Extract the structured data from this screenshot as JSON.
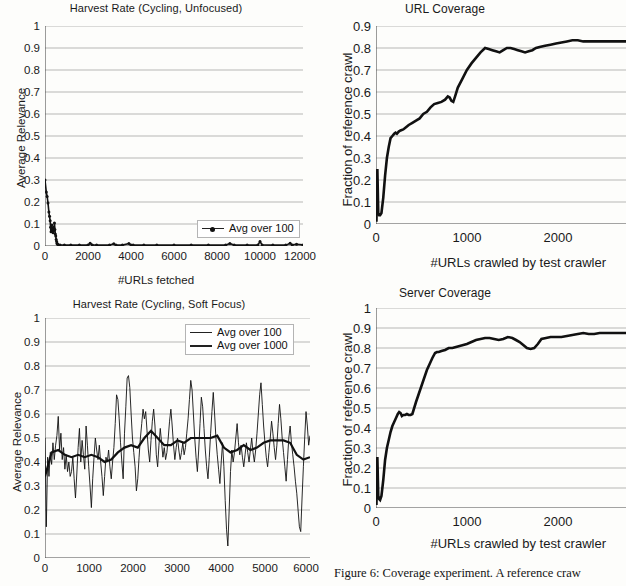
{
  "figure": {
    "caption": "Figure 6: Coverage experiment.  A reference craw",
    "background": "#fdfdfb",
    "line_color": "#111111",
    "grid_color": "#9a9a9a"
  },
  "charts": [
    {
      "id": "harvest-unfocused",
      "type": "line",
      "title": "Harvest Rate (Cycling, Unfocused)",
      "xlabel": "#URLs fetched",
      "ylabel": "Average Relevance",
      "xlim": [
        0,
        12000
      ],
      "ylim": [
        0,
        1
      ],
      "xticks": [
        0,
        2000,
        4000,
        6000,
        8000,
        10000,
        12000
      ],
      "yticks": [
        "0",
        "0.1",
        "0.2",
        "0.3",
        "0.4",
        "0.5",
        "0.6",
        "0.7",
        "0.8",
        "0.9",
        "1"
      ],
      "grid": true,
      "legend_position": "inside-bottom-right",
      "series": [
        {
          "name": "Avg over 100",
          "style": "thin-marker",
          "x": [
            0,
            60,
            100,
            140,
            180,
            210,
            240,
            260,
            280,
            300,
            320,
            340,
            360,
            380,
            400,
            420,
            440,
            460,
            480,
            500,
            520,
            540,
            560,
            580,
            620,
            700,
            900,
            1200,
            1600,
            2000,
            2100,
            2200,
            2400,
            3000,
            3200,
            3300,
            3600,
            3900,
            4000,
            4100,
            4600,
            5200,
            6000,
            6800,
            7600,
            8400,
            8600,
            8800,
            9400,
            9900,
            10000,
            10100,
            10600,
            11200,
            11400,
            11500,
            11700,
            12000
          ],
          "y": [
            0.3,
            0.245,
            0.225,
            0.195,
            0.155,
            0.135,
            0.115,
            0.085,
            0.065,
            0.075,
            0.095,
            0.065,
            0.08,
            0.06,
            0.085,
            0.07,
            0.105,
            0.075,
            0.055,
            0.045,
            0.03,
            0.02,
            0.012,
            0.008,
            0.006,
            0.005,
            0.004,
            0.004,
            0.004,
            0.004,
            0.012,
            0.005,
            0.004,
            0.004,
            0.01,
            0.004,
            0.004,
            0.011,
            0.005,
            0.004,
            0.004,
            0.004,
            0.004,
            0.004,
            0.004,
            0.004,
            0.011,
            0.004,
            0.004,
            0.004,
            0.02,
            0.005,
            0.004,
            0.004,
            0.012,
            0.005,
            0.008,
            0.005
          ]
        }
      ]
    },
    {
      "id": "harvest-soft-focus",
      "type": "line",
      "title": "Harvest Rate (Cycling, Soft Focus)",
      "xlabel": "",
      "ylabel": "Average Relevance",
      "xlim": [
        0,
        6000
      ],
      "ylim": [
        0,
        1
      ],
      "xticks": [
        0,
        1000,
        2000,
        3000,
        4000,
        5000,
        6000
      ],
      "yticks": [
        "0",
        "0.1",
        "0.2",
        "0.3",
        "0.4",
        "0.5",
        "0.6",
        "0.7",
        "0.8",
        "0.9",
        "1"
      ],
      "grid": true,
      "legend_position": "inside-top-right",
      "series": [
        {
          "name": "Avg over 100",
          "style": "thin",
          "x": [
            0,
            30,
            60,
            90,
            120,
            150,
            180,
            210,
            240,
            270,
            300,
            330,
            360,
            390,
            420,
            450,
            480,
            510,
            540,
            570,
            600,
            630,
            660,
            690,
            720,
            750,
            780,
            810,
            840,
            870,
            900,
            930,
            960,
            990,
            1020,
            1050,
            1080,
            1110,
            1140,
            1170,
            1200,
            1230,
            1260,
            1290,
            1320,
            1350,
            1380,
            1410,
            1440,
            1470,
            1500,
            1530,
            1560,
            1590,
            1620,
            1650,
            1680,
            1710,
            1740,
            1770,
            1800,
            1830,
            1860,
            1890,
            1920,
            1950,
            1980,
            2010,
            2040,
            2070,
            2100,
            2130,
            2160,
            2190,
            2220,
            2250,
            2280,
            2310,
            2340,
            2370,
            2400,
            2430,
            2460,
            2490,
            2520,
            2550,
            2580,
            2610,
            2640,
            2670,
            2700,
            2730,
            2760,
            2790,
            2820,
            2850,
            2880,
            2910,
            2940,
            2970,
            3000,
            3030,
            3060,
            3090,
            3120,
            3150,
            3180,
            3210,
            3240,
            3270,
            3300,
            3330,
            3360,
            3390,
            3420,
            3450,
            3480,
            3510,
            3540,
            3570,
            3600,
            3630,
            3660,
            3690,
            3720,
            3750,
            3780,
            3810,
            3840,
            3870,
            3900,
            3930,
            3960,
            3990,
            4020,
            4050,
            4080,
            4110,
            4140,
            4170,
            4200,
            4230,
            4260,
            4290,
            4320,
            4350,
            4380,
            4410,
            4440,
            4470,
            4500,
            4530,
            4560,
            4590,
            4620,
            4650,
            4680,
            4710,
            4740,
            4770,
            4800,
            4830,
            4860,
            4890,
            4920,
            4950,
            4980,
            5010,
            5040,
            5070,
            5100,
            5130,
            5160,
            5190,
            5220,
            5250,
            5280,
            5310,
            5340,
            5370,
            5400,
            5430,
            5460,
            5490,
            5520,
            5550,
            5580,
            5610,
            5640,
            5670,
            5700,
            5730,
            5760,
            5790,
            5820,
            5850,
            5880,
            5910,
            5940,
            5970,
            6000
          ],
          "y": [
            0.5,
            0.13,
            0.42,
            0.34,
            0.44,
            0.39,
            0.48,
            0.41,
            0.47,
            0.51,
            0.59,
            0.45,
            0.52,
            0.41,
            0.46,
            0.37,
            0.43,
            0.36,
            0.4,
            0.34,
            0.36,
            0.42,
            0.33,
            0.25,
            0.35,
            0.46,
            0.54,
            0.4,
            0.49,
            0.43,
            0.37,
            0.55,
            0.47,
            0.38,
            0.3,
            0.21,
            0.33,
            0.42,
            0.5,
            0.45,
            0.41,
            0.47,
            0.4,
            0.34,
            0.26,
            0.34,
            0.42,
            0.4,
            0.45,
            0.38,
            0.33,
            0.4,
            0.46,
            0.56,
            0.68,
            0.66,
            0.58,
            0.48,
            0.4,
            0.33,
            0.52,
            0.63,
            0.75,
            0.76,
            0.71,
            0.6,
            0.5,
            0.44,
            0.38,
            0.28,
            0.33,
            0.42,
            0.5,
            0.56,
            0.62,
            0.58,
            0.61,
            0.53,
            0.45,
            0.4,
            0.49,
            0.57,
            0.62,
            0.55,
            0.43,
            0.38,
            0.47,
            0.54,
            0.48,
            0.42,
            0.46,
            0.41,
            0.44,
            0.5,
            0.57,
            0.62,
            0.55,
            0.47,
            0.41,
            0.46,
            0.5,
            0.45,
            0.41,
            0.44,
            0.48,
            0.43,
            0.46,
            0.52,
            0.58,
            0.66,
            0.74,
            0.7,
            0.6,
            0.5,
            0.42,
            0.36,
            0.45,
            0.56,
            0.67,
            0.63,
            0.54,
            0.45,
            0.38,
            0.33,
            0.42,
            0.52,
            0.61,
            0.69,
            0.6,
            0.5,
            0.43,
            0.37,
            0.31,
            0.4,
            0.48,
            0.38,
            0.24,
            0.12,
            0.05,
            0.2,
            0.36,
            0.45,
            0.4,
            0.44,
            0.5,
            0.56,
            0.48,
            0.43,
            0.47,
            0.42,
            0.38,
            0.43,
            0.48,
            0.44,
            0.4,
            0.45,
            0.5,
            0.44,
            0.4,
            0.45,
            0.52,
            0.6,
            0.68,
            0.73,
            0.64,
            0.55,
            0.48,
            0.42,
            0.38,
            0.44,
            0.5,
            0.57,
            0.52,
            0.46,
            0.41,
            0.47,
            0.56,
            0.64,
            0.58,
            0.5,
            0.44,
            0.38,
            0.32,
            0.41,
            0.5,
            0.55,
            0.48,
            0.43,
            0.38,
            0.32,
            0.27,
            0.2,
            0.13,
            0.11,
            0.25,
            0.38,
            0.5,
            0.61,
            0.55,
            0.47,
            0.51
          ]
        },
        {
          "name": "Avg over 1000",
          "style": "thick",
          "x": [
            0,
            150,
            300,
            450,
            600,
            750,
            900,
            1050,
            1200,
            1350,
            1500,
            1650,
            1800,
            1950,
            2100,
            2250,
            2400,
            2550,
            2700,
            2850,
            3000,
            3150,
            3300,
            3450,
            3600,
            3750,
            3900,
            4050,
            4200,
            4350,
            4500,
            4650,
            4800,
            4950,
            5100,
            5250,
            5400,
            5550,
            5700,
            5850,
            6000
          ],
          "y": [
            0.34,
            0.44,
            0.45,
            0.43,
            0.42,
            0.43,
            0.42,
            0.43,
            0.42,
            0.4,
            0.41,
            0.44,
            0.46,
            0.47,
            0.46,
            0.5,
            0.53,
            0.5,
            0.47,
            0.47,
            0.49,
            0.48,
            0.5,
            0.5,
            0.5,
            0.5,
            0.51,
            0.46,
            0.44,
            0.45,
            0.47,
            0.45,
            0.46,
            0.48,
            0.49,
            0.49,
            0.49,
            0.48,
            0.43,
            0.41,
            0.42
          ]
        }
      ]
    },
    {
      "id": "url-coverage",
      "type": "line",
      "title": "URL Coverage",
      "xlabel": "#URLs crawled by test crawler",
      "ylabel": "Fraction of reference crawl",
      "xlim": [
        0,
        2750
      ],
      "ylim": [
        0,
        0.9
      ],
      "xticks": [
        0,
        1000,
        2000
      ],
      "yticks": [
        "0",
        "0.1",
        "0.2",
        "0.3",
        "0.4",
        "0.5",
        "0.6",
        "0.7",
        "0.8",
        "0.9"
      ],
      "grid": true,
      "clipped_right": true,
      "series": [
        {
          "name": "URL coverage",
          "style": "thick",
          "x": [
            5,
            15,
            25,
            35,
            45,
            60,
            80,
            100,
            120,
            140,
            160,
            180,
            200,
            215,
            230,
            250,
            270,
            300,
            330,
            360,
            400,
            440,
            480,
            520,
            560,
            600,
            640,
            680,
            720,
            760,
            790,
            810,
            830,
            850,
            870,
            900,
            950,
            1000,
            1050,
            1100,
            1150,
            1200,
            1240,
            1280,
            1320,
            1360,
            1400,
            1440,
            1480,
            1520,
            1560,
            1600,
            1640,
            1680,
            1720,
            1760,
            1800,
            1860,
            1920,
            1980,
            2040,
            2100,
            2160,
            2220,
            2280,
            2340,
            2400,
            2460,
            2520,
            2580,
            2640,
            2700,
            2750
          ],
          "y": [
            0.01,
            0.25,
            0.05,
            0.04,
            0.04,
            0.05,
            0.12,
            0.22,
            0.3,
            0.35,
            0.39,
            0.4,
            0.41,
            0.415,
            0.41,
            0.42,
            0.425,
            0.43,
            0.44,
            0.45,
            0.46,
            0.47,
            0.48,
            0.5,
            0.51,
            0.53,
            0.545,
            0.55,
            0.555,
            0.565,
            0.58,
            0.575,
            0.56,
            0.555,
            0.58,
            0.62,
            0.66,
            0.7,
            0.73,
            0.755,
            0.78,
            0.8,
            0.795,
            0.79,
            0.785,
            0.78,
            0.79,
            0.8,
            0.8,
            0.795,
            0.79,
            0.785,
            0.78,
            0.785,
            0.79,
            0.8,
            0.805,
            0.81,
            0.815,
            0.82,
            0.825,
            0.83,
            0.835,
            0.835,
            0.83,
            0.83,
            0.83,
            0.83,
            0.83,
            0.83,
            0.83,
            0.83,
            0.83
          ]
        }
      ]
    },
    {
      "id": "server-coverage",
      "type": "line",
      "title": "Server Coverage",
      "xlabel": "#URLs crawled by test crawler",
      "ylabel": "Fraction of reference crawl",
      "xlim": [
        0,
        2750
      ],
      "ylim": [
        0,
        1
      ],
      "xticks": [
        0,
        1000,
        2000
      ],
      "yticks": [
        "0",
        "0.1",
        "0.2",
        "0.3",
        "0.4",
        "0.5",
        "0.6",
        "0.7",
        "0.8",
        "0.9",
        "1"
      ],
      "grid": true,
      "clipped_right": true,
      "series": [
        {
          "name": "Server coverage",
          "style": "thick",
          "x": [
            5,
            15,
            25,
            35,
            45,
            60,
            80,
            100,
            120,
            140,
            160,
            180,
            200,
            220,
            240,
            255,
            270,
            285,
            300,
            320,
            340,
            360,
            380,
            400,
            420,
            440,
            470,
            500,
            530,
            560,
            590,
            620,
            650,
            670,
            690,
            720,
            760,
            800,
            840,
            880,
            920,
            960,
            1000,
            1050,
            1100,
            1150,
            1200,
            1250,
            1300,
            1350,
            1400,
            1450,
            1500,
            1540,
            1580,
            1620,
            1660,
            1700,
            1740,
            1780,
            1820,
            1870,
            1920,
            1980,
            2040,
            2100,
            2160,
            2220,
            2280,
            2340,
            2400,
            2460,
            2520,
            2580,
            2640,
            2700,
            2750
          ],
          "y": [
            0.015,
            0.255,
            0.06,
            0.045,
            0.04,
            0.06,
            0.14,
            0.24,
            0.3,
            0.34,
            0.38,
            0.41,
            0.43,
            0.45,
            0.47,
            0.48,
            0.475,
            0.46,
            0.465,
            0.465,
            0.47,
            0.465,
            0.465,
            0.47,
            0.5,
            0.53,
            0.57,
            0.61,
            0.65,
            0.69,
            0.72,
            0.75,
            0.775,
            0.78,
            0.78,
            0.785,
            0.79,
            0.8,
            0.8,
            0.805,
            0.81,
            0.815,
            0.82,
            0.83,
            0.84,
            0.845,
            0.85,
            0.85,
            0.845,
            0.84,
            0.845,
            0.855,
            0.85,
            0.84,
            0.83,
            0.815,
            0.8,
            0.795,
            0.8,
            0.82,
            0.845,
            0.85,
            0.855,
            0.855,
            0.855,
            0.86,
            0.865,
            0.87,
            0.875,
            0.87,
            0.87,
            0.875,
            0.875,
            0.875,
            0.875,
            0.875,
            0.875
          ]
        }
      ]
    }
  ]
}
